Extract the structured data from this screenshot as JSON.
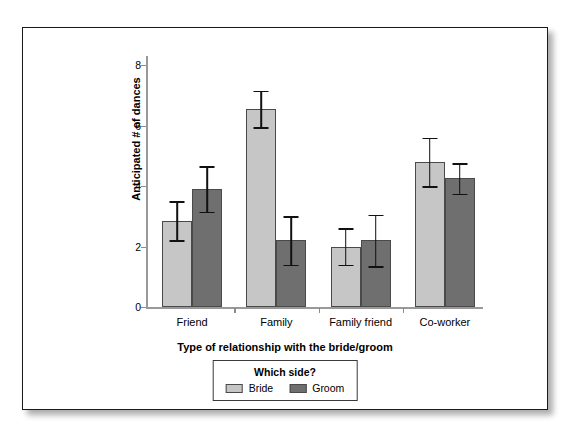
{
  "chart_data": {
    "type": "bar",
    "title": "",
    "xlabel": "Type of relationship with the bride/groom",
    "ylabel": "Anticipated # of dances",
    "categories": [
      "Friend",
      "Family",
      "Family friend",
      "Co-worker"
    ],
    "ylim": [
      0,
      8.3
    ],
    "yticks": [
      0,
      2,
      4,
      6,
      8
    ],
    "ytick_labels": [
      "0",
      "2",
      "4",
      "6",
      "8"
    ],
    "grid": false,
    "legend_position": "below-axes",
    "legend_title": "Which side?",
    "series": [
      {
        "name": "Bride",
        "color": "#c6c6c6",
        "values": [
          2.85,
          6.55,
          2.0,
          4.8
        ],
        "errors": [
          0.65,
          0.6,
          0.6,
          0.8
        ]
      },
      {
        "name": "Groom",
        "color": "#6f6f6f",
        "values": [
          3.9,
          2.2,
          2.2,
          4.25
        ],
        "errors": [
          0.75,
          0.8,
          0.85,
          0.5
        ]
      }
    ]
  },
  "figure": {
    "legend": {
      "title": "Which side?",
      "entries": [
        {
          "label": "Bride",
          "swatch": "bride"
        },
        {
          "label": "Groom",
          "swatch": "groom"
        }
      ]
    }
  }
}
